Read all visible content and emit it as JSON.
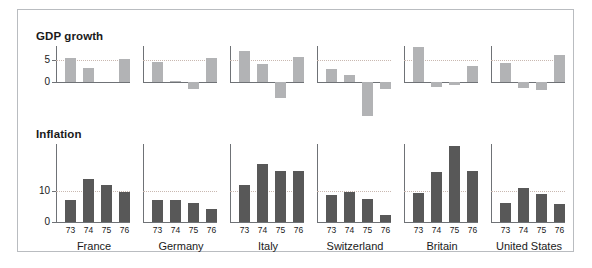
{
  "figure": {
    "border_color": "#b9bcc0",
    "background": "#ffffff"
  },
  "panels": {
    "gdp_title": "GDP growth",
    "inflation_title": "Inflation"
  },
  "axis": {
    "gdp_ticks": [
      "5",
      "0"
    ],
    "inflation_ticks": [
      "10",
      "0"
    ]
  },
  "colors": {
    "gdp_bar": "#b2b3b5",
    "inflation_bar": "#585858",
    "axis": "#6f7276",
    "gridline": "#c9b8b0"
  },
  "countries": [
    "France",
    "Germany",
    "Italy",
    "Switzerland",
    "Britain",
    "United States"
  ],
  "year_labels": [
    "73",
    "74",
    "75",
    "76"
  ],
  "chart_data": [
    {
      "type": "bar",
      "title": "GDP growth",
      "xlabel": "",
      "ylabel": "",
      "categories": [
        "73",
        "74",
        "75",
        "76"
      ],
      "ylim": [
        -8,
        8
      ],
      "yticks": [
        0,
        5
      ],
      "grid": true,
      "legend": "none",
      "series": [
        {
          "name": "France",
          "values": [
            5.4,
            3.2,
            0.0,
            5.2
          ]
        },
        {
          "name": "Germany",
          "values": [
            4.4,
            0.3,
            -1.6,
            5.3
          ]
        },
        {
          "name": "Italy",
          "values": [
            6.9,
            3.9,
            -3.5,
            5.6
          ]
        },
        {
          "name": "Switzerland",
          "values": [
            3.0,
            1.5,
            -7.5,
            -1.5
          ]
        },
        {
          "name": "Britain",
          "values": [
            7.8,
            -1.0,
            -0.7,
            3.6
          ]
        },
        {
          "name": "United States",
          "values": [
            4.2,
            -1.4,
            -1.8,
            6.1
          ]
        }
      ]
    },
    {
      "type": "bar",
      "title": "Inflation",
      "xlabel": "",
      "ylabel": "",
      "categories": [
        "73",
        "74",
        "75",
        "76"
      ],
      "ylim": [
        0,
        25
      ],
      "yticks": [
        0,
        10
      ],
      "grid": true,
      "legend": "none",
      "series": [
        {
          "name": "France",
          "values": [
            7.2,
            13.7,
            11.8,
            9.6
          ]
        },
        {
          "name": "Germany",
          "values": [
            6.9,
            7.0,
            6.0,
            4.3
          ]
        },
        {
          "name": "Italy",
          "values": [
            11.8,
            18.5,
            16.5,
            16.3
          ]
        },
        {
          "name": "Switzerland",
          "values": [
            8.8,
            9.7,
            7.5,
            2.1
          ]
        },
        {
          "name": "Britain",
          "values": [
            9.2,
            16.0,
            24.2,
            16.5
          ]
        },
        {
          "name": "United States",
          "values": [
            6.2,
            11.0,
            9.1,
            5.8
          ]
        }
      ]
    }
  ]
}
